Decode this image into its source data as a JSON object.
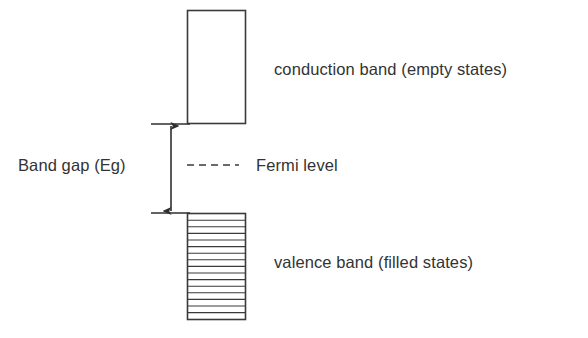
{
  "diagram": {
    "type": "band-structure-diagram",
    "background_color": "#ffffff",
    "stroke_color": "#3a3a3a",
    "text_color": "#333333",
    "bands": [
      {
        "id": "conduction-band",
        "label": "conduction band (empty states)",
        "fill": "empty",
        "rect": {
          "x": 187,
          "y": 10,
          "width": 59,
          "height": 114
        },
        "hatch_lines": 0
      },
      {
        "id": "valence-band",
        "label": "valence band (filled states)",
        "fill": "filled",
        "rect": {
          "x": 187,
          "y": 213,
          "width": 59,
          "height": 107
        },
        "hatch_lines": 15
      }
    ],
    "gap": {
      "label": "Band gap (Eg)",
      "arrow": {
        "x": 171,
        "y_top": 124,
        "y_bottom": 213,
        "double_headed": true
      },
      "ticks": [
        {
          "y": 124,
          "x_start": 151,
          "x_end": 190
        },
        {
          "y": 213,
          "x_start": 151,
          "x_end": 190
        }
      ]
    },
    "fermi_level": {
      "label": "Fermi level",
      "line_style": "dashed",
      "y": 165,
      "x_start": 187,
      "x_end": 239,
      "dash_count": 5
    }
  }
}
